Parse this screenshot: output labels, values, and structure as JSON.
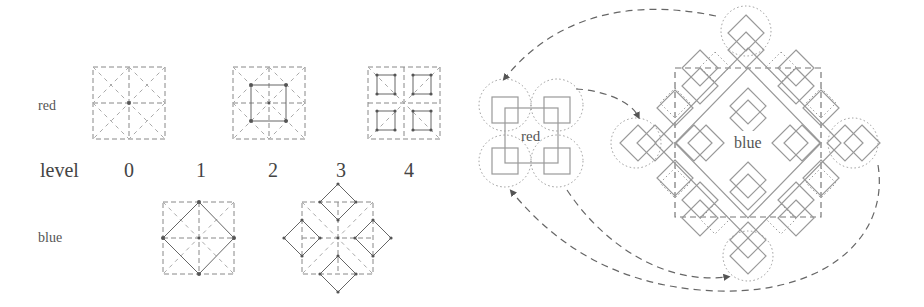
{
  "left_panel": {
    "row_labels": {
      "red": "red",
      "blue": "blue"
    },
    "level_row": {
      "title": "level",
      "levels": [
        "0",
        "1",
        "2",
        "3",
        "4"
      ]
    }
  },
  "right_panel": {
    "red_cluster_label": "red",
    "blue_cluster_label": "blue"
  },
  "colors": {
    "line": "#666666",
    "grid_dash": "#888888",
    "dotted_circle": "#999999",
    "text": "#555555"
  }
}
